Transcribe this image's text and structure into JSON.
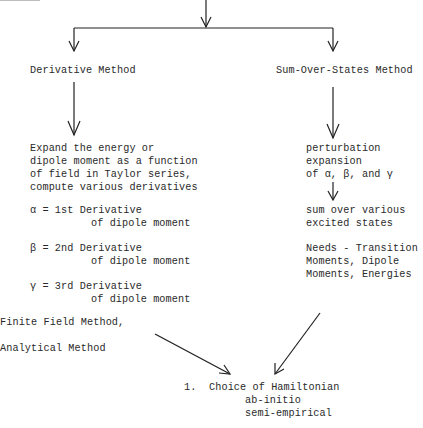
{
  "diagram": {
    "branches": {
      "left": {
        "title": "Derivative Method",
        "description": [
          "Expand the energy or",
          "dipole moment as a function",
          "of field in Taylor series,",
          "compute various derivatives"
        ],
        "definitions": [
          {
            "line1": "α = 1st Derivative",
            "line2": "of dipole moment"
          },
          {
            "line1": "β = 2nd Derivative",
            "line2": "of dipole moment"
          },
          {
            "line1": "γ = 3rd Derivative",
            "line2": "of dipole moment"
          }
        ],
        "methods": [
          "Finite Field Method,",
          "Analytical Method"
        ]
      },
      "right": {
        "title": "Sum-Over-States Method",
        "step1": [
          "perturbation",
          "expansion",
          "of α, β, and γ"
        ],
        "step2": [
          "sum over various",
          "excited states"
        ],
        "needs": [
          "Needs - Transition",
          "Moments, Dipole",
          "Moments, Energies"
        ]
      }
    },
    "result": {
      "number": "1.",
      "title": "Choice of Hamiltonian",
      "options": [
        "ab-initio",
        "semi-empirical"
      ]
    },
    "colors": {
      "line": "#222222",
      "text": "#2a2a2a",
      "background": "#ffffff"
    }
  }
}
